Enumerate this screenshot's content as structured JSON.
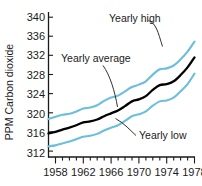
{
  "chart_data": {
    "type": "line",
    "title": "",
    "xlabel": "",
    "ylabel": "PPM Carbon dioxide",
    "xlim": [
      1958,
      1979
    ],
    "ylim": [
      312,
      341
    ],
    "yticks": [
      312,
      316,
      320,
      324,
      328,
      332,
      336,
      340
    ],
    "xticks": [
      1958,
      1962,
      1966,
      1970,
      1974,
      1978
    ],
    "xticks_minor": [
      1959,
      1960,
      1961,
      1963,
      1964,
      1965,
      1967,
      1968,
      1969,
      1971,
      1972,
      1973,
      1975,
      1976,
      1977,
      1979
    ],
    "grid": false,
    "legend_position": "inline-annotations",
    "x": [
      1958,
      1959,
      1960,
      1961,
      1962,
      1963,
      1964,
      1965,
      1966,
      1967,
      1968,
      1969,
      1970,
      1971,
      1972,
      1973,
      1974,
      1975,
      1976,
      1977,
      1978,
      1979
    ],
    "series": [
      {
        "name": "Yearly high",
        "color": "#6BBEDC",
        "values": [
          318.7,
          319.2,
          319.6,
          319.8,
          320.3,
          320.9,
          321.1,
          321.6,
          322.5,
          323.2,
          323.6,
          324.5,
          325.4,
          325.9,
          326.6,
          328.0,
          329.1,
          329.3,
          329.9,
          331.2,
          332.8,
          334.9
        ]
      },
      {
        "name": "Yearly average",
        "color": "#000000",
        "values": [
          315.7,
          316.0,
          316.5,
          316.9,
          317.4,
          318.0,
          318.2,
          318.6,
          319.3,
          319.9,
          320.5,
          321.4,
          322.4,
          322.8,
          323.5,
          324.8,
          325.8,
          326.0,
          326.6,
          327.9,
          329.5,
          331.6
        ]
      },
      {
        "name": "Yearly low",
        "color": "#6BBEDC",
        "values": [
          313.0,
          313.2,
          313.6,
          314.0,
          314.5,
          315.0,
          315.2,
          315.6,
          316.3,
          316.9,
          317.4,
          318.3,
          319.3,
          319.7,
          320.3,
          321.5,
          322.4,
          322.6,
          323.2,
          324.5,
          326.0,
          328.2
        ]
      }
    ],
    "annotations": [
      {
        "text": "Yearly high",
        "label_x": 109,
        "label_y": 22,
        "anchor": "start"
      },
      {
        "text": "Yearly average",
        "label_x": 61,
        "label_y": 62,
        "anchor": "start"
      },
      {
        "text": "Yearly low",
        "label_x": 139,
        "label_y": 139,
        "anchor": "start"
      }
    ]
  },
  "axis": {
    "ytitle": "PPM Carbon dioxide",
    "ytick_labels": [
      "340",
      "336",
      "332",
      "328",
      "324",
      "320",
      "316",
      "312"
    ],
    "xtick_labels": [
      "1958",
      "1962",
      "1966",
      "1970",
      "1974",
      "1978"
    ]
  },
  "colors": {
    "series_blue": "#6BBEDC",
    "series_black": "#000000",
    "axis": "#1a1a1a",
    "background": "#ffffff"
  }
}
